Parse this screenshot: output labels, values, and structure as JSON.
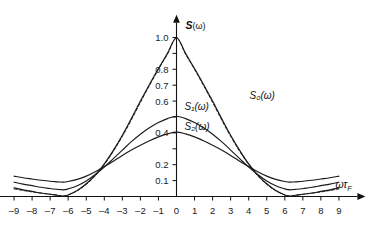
{
  "chart_data": {
    "type": "line",
    "title": "",
    "xlabel": "ωτ_F",
    "ylabel": "S(ω)",
    "xlim": [
      -9.8,
      9.8
    ],
    "ylim": [
      0,
      1.08
    ],
    "grid": false,
    "legend_position": "inline-labels",
    "x_ticks": [
      -9,
      -8,
      -7,
      -6,
      -5,
      -4,
      -3,
      -2,
      -1,
      0,
      1,
      2,
      3,
      4,
      5,
      6,
      7,
      8,
      9
    ],
    "x_tick_labels": [
      "–9",
      "–8",
      "–7",
      "–6",
      "–5",
      "–4",
      "–3",
      "–2",
      "–1",
      "0",
      "1",
      "2",
      "3",
      "4",
      "5",
      "6",
      "7",
      "8",
      "9"
    ],
    "y_ticks": [
      0.1,
      0.2,
      0.3,
      0.4,
      0.5,
      0.6,
      0.7,
      0.8,
      0.9,
      1.0
    ],
    "y_tick_labels": [
      "0.1",
      "0.2",
      "",
      "0.4",
      "",
      "0.6",
      "0.7",
      "0.8",
      "",
      "1.0"
    ],
    "x": [
      -9,
      -8.5,
      -8,
      -7.5,
      -7,
      -6.8,
      -6.6,
      -6.4,
      -6.3,
      -6.2,
      -6,
      -5.5,
      -5,
      -4.5,
      -4,
      -3.5,
      -3,
      -2.5,
      -2,
      -1.5,
      -1,
      -0.5,
      0,
      0.5,
      1,
      1.5,
      2,
      2.5,
      3,
      3.5,
      4,
      4.5,
      5,
      5.5,
      6,
      6.2,
      6.3,
      6.4,
      6.6,
      6.8,
      7,
      7.5,
      8,
      8.5,
      9
    ],
    "series": [
      {
        "name": "S_0(ω)",
        "label": "S₀(ω)",
        "style": "solid",
        "peak": 1.0,
        "values": [
          0.055,
          0.042,
          0.032,
          0.022,
          0.014,
          0.011,
          0.008,
          0.004,
          0.002,
          0.004,
          0.01,
          0.038,
          0.08,
          0.135,
          0.205,
          0.29,
          0.385,
          0.49,
          0.6,
          0.705,
          0.805,
          0.9,
          1.0,
          0.9,
          0.805,
          0.705,
          0.6,
          0.49,
          0.385,
          0.29,
          0.205,
          0.135,
          0.08,
          0.038,
          0.01,
          0.004,
          0.002,
          0.004,
          0.008,
          0.011,
          0.014,
          0.022,
          0.032,
          0.042,
          0.055
        ]
      },
      {
        "name": "S_1(ω)",
        "label": "S₁(ω)",
        "style": "solid",
        "peak": 0.505,
        "values": [
          0.09,
          0.078,
          0.068,
          0.058,
          0.05,
          0.047,
          0.045,
          0.043,
          0.042,
          0.043,
          0.048,
          0.068,
          0.098,
          0.138,
          0.185,
          0.238,
          0.292,
          0.345,
          0.392,
          0.432,
          0.465,
          0.49,
          0.505,
          0.49,
          0.465,
          0.432,
          0.392,
          0.345,
          0.292,
          0.238,
          0.185,
          0.138,
          0.098,
          0.068,
          0.048,
          0.043,
          0.042,
          0.043,
          0.045,
          0.047,
          0.05,
          0.058,
          0.068,
          0.078,
          0.09
        ]
      },
      {
        "name": "S_2(ω)",
        "label": "S₂(ω)",
        "style": "solid",
        "peak": 0.405,
        "values": [
          0.128,
          0.118,
          0.11,
          0.102,
          0.096,
          0.094,
          0.092,
          0.091,
          0.09,
          0.091,
          0.094,
          0.108,
          0.128,
          0.155,
          0.188,
          0.222,
          0.258,
          0.292,
          0.322,
          0.35,
          0.375,
          0.394,
          0.405,
          0.394,
          0.375,
          0.35,
          0.322,
          0.292,
          0.258,
          0.222,
          0.188,
          0.155,
          0.128,
          0.108,
          0.094,
          0.091,
          0.09,
          0.091,
          0.092,
          0.094,
          0.096,
          0.102,
          0.11,
          0.118,
          0.128
        ]
      },
      {
        "name": "S_dashed",
        "label": "",
        "style": "dashed",
        "peak": 0.05,
        "values": [
          0.048,
          0.038,
          0.029,
          0.021,
          0.014,
          0.011,
          0.008,
          0.004,
          0.002,
          0.004,
          0.01,
          0.036,
          0.076,
          0.13,
          0.2,
          0.284,
          0.378,
          0.482,
          0.592,
          0.698,
          0.799,
          0.896,
          0.996,
          0.896,
          0.799,
          0.698,
          0.592,
          0.482,
          0.378,
          0.284,
          0.2,
          0.13,
          0.076,
          0.036,
          0.01,
          0.004,
          0.002,
          0.004,
          0.008,
          0.011,
          0.014,
          0.021,
          0.029,
          0.038,
          0.048
        ]
      }
    ],
    "annotations": [
      {
        "name": "label-s0",
        "text": "S₀(ω)",
        "x": 4.05,
        "y": 0.615
      },
      {
        "name": "label-s1",
        "text": "S₁(ω)",
        "x": 0.45,
        "y": 0.545
      },
      {
        "name": "label-s2",
        "text": "S₂(ω)",
        "x": 0.45,
        "y": 0.418
      }
    ]
  },
  "axis": {
    "y_title_main": "S",
    "y_title_arg": "(ω)",
    "x_title_main": "ωτ",
    "x_title_sub": "F"
  }
}
